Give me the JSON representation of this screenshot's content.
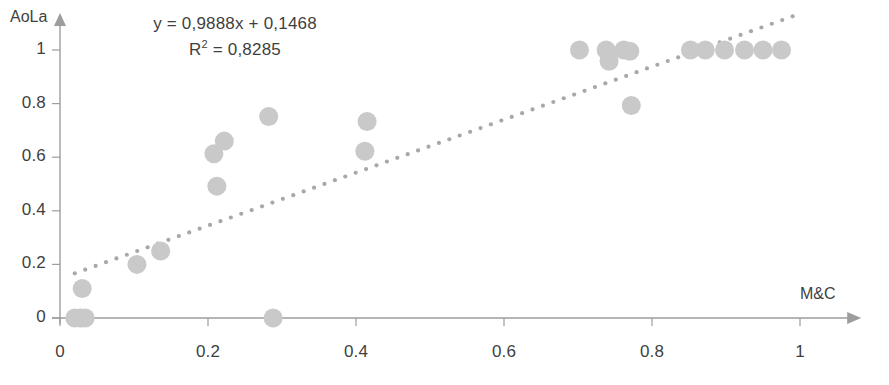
{
  "chart_data": {
    "type": "scatter",
    "title": "",
    "xlabel": "M&C",
    "ylabel": "AoLa",
    "xlim": [
      0,
      1.08
    ],
    "ylim": [
      0,
      1.06
    ],
    "xticks": [
      "0",
      "0.2",
      "0.4",
      "0.6",
      "0.8",
      "1"
    ],
    "xtick_values": [
      0,
      0.2,
      0.4,
      0.6,
      0.8,
      1
    ],
    "yticks": [
      "0",
      "0.2",
      "0.4",
      "0.6",
      "0.8",
      "1"
    ],
    "ytick_values": [
      0,
      0.2,
      0.4,
      0.6,
      0.8,
      1
    ],
    "grid": false,
    "legend": "none",
    "marker_color": "#c9c9c9",
    "axis_color": "#9d9d9d",
    "text_color": "#3f3f3f",
    "trendline": {
      "type": "linear",
      "style": "dotted",
      "color": "#a8a8a8",
      "slope": 0.9888,
      "intercept": 0.1468,
      "x_start": 0.02,
      "x_end": 0.99
    },
    "annotations": {
      "equation": "y = 0,9888x + 0,1468",
      "r_squared_label": "R",
      "r_squared_exponent": "2",
      "r_squared_value": " = 0,8285"
    },
    "points": [
      {
        "x": 0.02,
        "y": 0.0
      },
      {
        "x": 0.028,
        "y": 0.0
      },
      {
        "x": 0.034,
        "y": 0.0
      },
      {
        "x": 0.03,
        "y": 0.11
      },
      {
        "x": 0.104,
        "y": 0.2
      },
      {
        "x": 0.136,
        "y": 0.25
      },
      {
        "x": 0.212,
        "y": 0.492
      },
      {
        "x": 0.208,
        "y": 0.613
      },
      {
        "x": 0.222,
        "y": 0.66
      },
      {
        "x": 0.282,
        "y": 0.752
      },
      {
        "x": 0.288,
        "y": 0.0
      },
      {
        "x": 0.412,
        "y": 0.622
      },
      {
        "x": 0.415,
        "y": 0.733
      },
      {
        "x": 0.702,
        "y": 1.0
      },
      {
        "x": 0.738,
        "y": 1.0
      },
      {
        "x": 0.742,
        "y": 0.958
      },
      {
        "x": 0.762,
        "y": 1.0
      },
      {
        "x": 0.77,
        "y": 0.995
      },
      {
        "x": 0.772,
        "y": 0.793
      },
      {
        "x": 0.852,
        "y": 1.0
      },
      {
        "x": 0.872,
        "y": 1.0
      },
      {
        "x": 0.898,
        "y": 1.0
      },
      {
        "x": 0.925,
        "y": 1.0
      },
      {
        "x": 0.95,
        "y": 1.0
      },
      {
        "x": 0.975,
        "y": 1.0
      }
    ]
  }
}
